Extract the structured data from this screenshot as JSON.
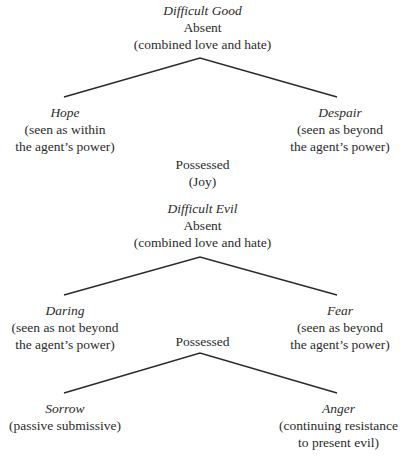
{
  "diagram": {
    "good": {
      "title": "Difficult Good",
      "absent": "Absent",
      "absent_note": "(combined love and hate)",
      "left": {
        "name": "Hope",
        "line1": "(seen as within",
        "line2": "the agent’s power)"
      },
      "right": {
        "name": "Despair",
        "line1": "(seen as beyond",
        "line2": "the agent’s power)"
      },
      "possessed": "Possessed",
      "possessed_note": "(Joy)"
    },
    "evil": {
      "title": "Difficult Evil",
      "absent": "Absent",
      "absent_note": "(combined love and hate)",
      "left": {
        "name": "Daring",
        "line1": "(seen as not beyond",
        "line2": "the agent’s power)"
      },
      "right": {
        "name": "Fear",
        "line1": "(seen as beyond",
        "line2": "the agent’s power)"
      },
      "possessed": "Possessed",
      "possessed_left": {
        "name": "Sorrow",
        "line1": "(passive submissive)"
      },
      "possessed_right": {
        "name": "Anger",
        "line1": "(continuing resistance",
        "line2": "to present evil)"
      }
    },
    "line_color": "#2b2b2b"
  }
}
